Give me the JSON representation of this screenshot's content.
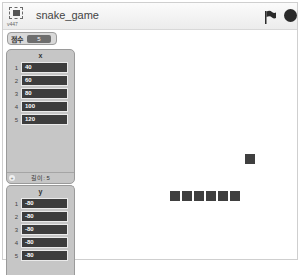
{
  "header": {
    "fullscreen_label": "v447",
    "title": "snake_game",
    "green_flag": "green-flag-icon",
    "stop": "stop-icon"
  },
  "variable_monitor": {
    "label": "점수",
    "value": "5"
  },
  "lists": [
    {
      "title": "x",
      "items": [
        {
          "index": "1",
          "value": "40"
        },
        {
          "index": "2",
          "value": "60"
        },
        {
          "index": "3",
          "value": "80"
        },
        {
          "index": "4",
          "value": "100"
        },
        {
          "index": "5",
          "value": "120"
        }
      ],
      "footer": "길이: 5",
      "add_button": "+"
    },
    {
      "title": "y",
      "items": [
        {
          "index": "1",
          "value": "-80"
        },
        {
          "index": "2",
          "value": "-80"
        },
        {
          "index": "3",
          "value": "-80"
        },
        {
          "index": "4",
          "value": "-80"
        },
        {
          "index": "5",
          "value": "-80"
        }
      ]
    }
  ],
  "stage": {
    "food": {
      "x": 242,
      "y": 124
    },
    "snake_segments": [
      {
        "x": 167,
        "y": 161
      },
      {
        "x": 179,
        "y": 161
      },
      {
        "x": 191,
        "y": 161
      },
      {
        "x": 203,
        "y": 161
      },
      {
        "x": 215,
        "y": 161
      },
      {
        "x": 227,
        "y": 161
      }
    ]
  }
}
